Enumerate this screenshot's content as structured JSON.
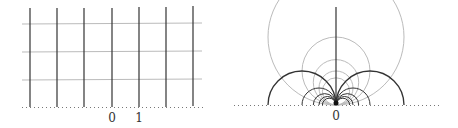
{
  "diagram": {
    "left_panel": {
      "description": "Grid of vertical lines (dark) and horizontal lines (gray) in upper half-plane",
      "vertical_lines_x_values": [
        -3,
        -2,
        -1,
        0,
        1,
        2,
        3
      ],
      "horizontal_lines_y_values": [
        1,
        2,
        3
      ],
      "axis_labels": [
        {
          "text": "0",
          "x": 0
        },
        {
          "text": "1",
          "x": 1
        }
      ],
      "colors": {
        "vertical": "#333333",
        "horizontal": "#bbbbbb",
        "baseline": "#777777"
      }
    },
    "right_panel": {
      "description": "Image of grid under z -> -1/z: vertical lines map to semicircles through origin, horizontal lines map to circles tangent at origin",
      "axis_labels": [
        {
          "text": "0",
          "x": 0
        }
      ],
      "colors": {
        "semicircles": "#333333",
        "circles": "#bbbbbb",
        "baseline": "#777777"
      }
    }
  }
}
